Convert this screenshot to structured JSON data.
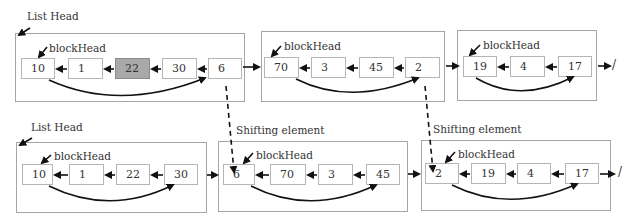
{
  "labels": {
    "list_head": "List Head",
    "block_head": "blockHead",
    "shifting_element": "Shifting element",
    "null_terminator": "/"
  },
  "colors": {
    "highlight_node": "#a9a9a9",
    "border": "#a6a6a6",
    "arrow": "#111111"
  },
  "top_row": {
    "blocks": [
      {
        "nodes": [
          "10",
          "1",
          "22",
          "30",
          "6"
        ],
        "highlighted_index": 2
      },
      {
        "nodes": [
          "70",
          "3",
          "45",
          "2"
        ]
      },
      {
        "nodes": [
          "19",
          "4",
          "17"
        ]
      }
    ]
  },
  "bottom_row": {
    "blocks": [
      {
        "nodes": [
          "10",
          "1",
          "22",
          "30"
        ]
      },
      {
        "nodes": [
          "6",
          "70",
          "3",
          "45"
        ]
      },
      {
        "nodes": [
          "2",
          "19",
          "4",
          "17"
        ]
      }
    ]
  }
}
